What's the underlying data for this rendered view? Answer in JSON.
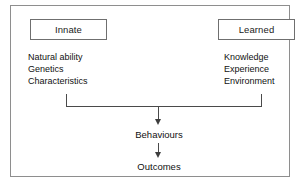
{
  "diagram": {
    "frame_border_color": "#8e8e8e",
    "background_color": "#ffffff",
    "line_color": "#4a4a4a",
    "text_color": "#111111",
    "columns": [
      {
        "id": "innate",
        "heading": "Innate",
        "items": [
          "Natural ability",
          "Genetics",
          "Characteristics"
        ]
      },
      {
        "id": "learned",
        "heading": "Learned",
        "items": [
          "Knowledge",
          "Experience",
          "Environment"
        ]
      }
    ],
    "flow": [
      {
        "id": "behaviours",
        "label": "Behaviours"
      },
      {
        "id": "outcomes",
        "label": "Outcomes"
      }
    ],
    "connectors": [
      {
        "id": "bracket",
        "type": "bracket-merge",
        "from": [
          "innate",
          "learned"
        ],
        "to": "behaviours"
      },
      {
        "id": "arrow-behaviours-outcomes",
        "type": "arrow",
        "from": "behaviours",
        "to": "outcomes"
      }
    ]
  }
}
